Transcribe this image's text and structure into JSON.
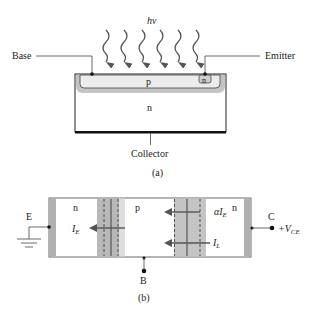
{
  "figure_a": {
    "photon_label": "hν",
    "base_label": "Base",
    "emitter_label": "Emitter",
    "collector_label": "Collector",
    "p_region_label": "p",
    "n_emitter_label": "n",
    "n_bulk_label": "n",
    "caption": "(a)",
    "photon_arrow_count": 6
  },
  "figure_b": {
    "left_region_label": "n",
    "middle_region_label": "p",
    "right_region_label": "n",
    "emitter_terminal": "E",
    "collector_terminal": "C",
    "base_terminal": "B",
    "collector_voltage": "+V",
    "collector_voltage_sub": "CE",
    "current_emitter": "I",
    "current_emitter_sub": "E",
    "current_alpha": "αI",
    "current_alpha_sub": "E",
    "current_light": "I",
    "current_light_sub": "L",
    "caption": "(b)"
  },
  "colors": {
    "line": "#222222",
    "depletion_dark": "#b4b4b4",
    "depletion_light": "#dcdcdc",
    "p_region_fill": "#ececec",
    "contact_strip": "#b0b0b0",
    "arrow": "#555555"
  }
}
